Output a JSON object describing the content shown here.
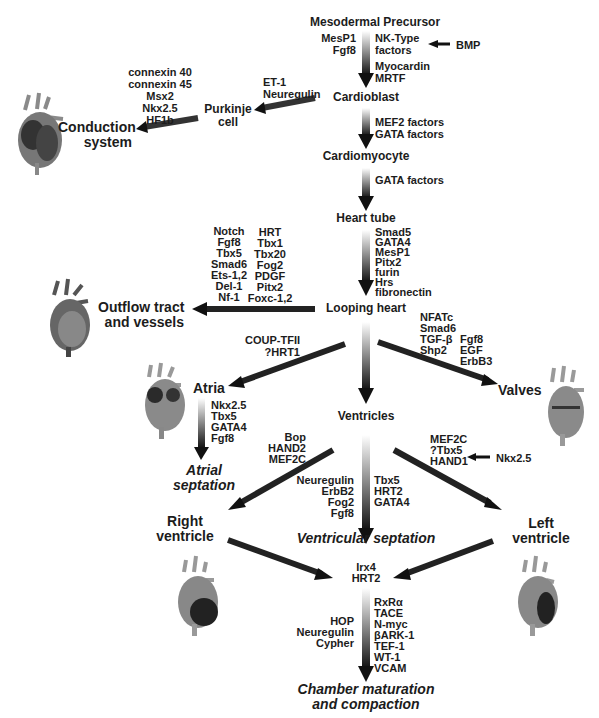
{
  "diagram": {
    "stages": {
      "mesodermal_precursor": "Mesodermal Precursor",
      "cardioblast": "Cardioblast",
      "cardiomyocyte": "Cardiomyocyte",
      "heart_tube": "Heart tube",
      "looping_heart": "Looping heart",
      "ventricles": "Ventricles",
      "purkinje_cell": [
        "Purkinje",
        "cell"
      ],
      "conduction_system": [
        "Conduction",
        "system"
      ],
      "outflow_tract": [
        "Outflow tract",
        "and vessels"
      ],
      "atria": "Atria",
      "valves": "Valves",
      "right_ventricle": [
        "Right",
        "ventricle"
      ],
      "left_ventricle": [
        "Left",
        "ventricle"
      ],
      "atrial_septation": [
        "Atrial",
        "septation"
      ],
      "ventricular_septation": "Ventricular septation",
      "chamber_maturation": [
        "Chamber maturation",
        "and compaction"
      ]
    },
    "factors": {
      "precursor_left": [
        "MesP1",
        "Fgf8"
      ],
      "precursor_right": [
        "NK-Type",
        "factors"
      ],
      "bmp": "BMP",
      "myocardin": [
        "Myocardin",
        "MRTF"
      ],
      "cardioblast_to_cardiomyocyte": [
        "MEF2 factors",
        "GATA factors"
      ],
      "cardiomyocyte_to_tube": [
        "GATA factors"
      ],
      "purkinje_inputs": [
        "ET-1",
        "Neuregulin"
      ],
      "conduction_factors": [
        "connexin 40",
        "connexin 45",
        "Msx2",
        "Nkx2.5",
        "HF1b"
      ],
      "tube_to_looping": [
        "Smad5",
        "GATA4",
        "MesP1",
        "Pitx2",
        "furin",
        "Hrs",
        "fibronectin"
      ],
      "outflow_col1": [
        "Notch",
        "Fgf8",
        "Tbx5",
        "Smad6",
        "Ets-1,2",
        "Del-1",
        "Nf-1"
      ],
      "outflow_col2": [
        "HRT",
        "Tbx1",
        "Tbx20",
        "Fog2",
        "PDGF",
        "Pitx2",
        "Foxc-1,2"
      ],
      "atria_inputs": [
        "COUP-TFII",
        "?HRT1"
      ],
      "valves_col1": [
        "NFATc",
        "Smad6",
        "TGF-β",
        "Shp2"
      ],
      "valves_col2": [
        "Fgf8",
        "EGF",
        "ErbB3"
      ],
      "atrial_septation": [
        "Nkx2.5",
        "Tbx5",
        "GATA4",
        "Fgf8"
      ],
      "right_ventricle_inputs": [
        "Bop",
        "HAND2",
        "MEF2C"
      ],
      "left_ventricle_inputs": [
        "MEF2C",
        "?Tbx5",
        "HAND1"
      ],
      "nkx25_hand1": "Nkx2.5",
      "vsept_left": [
        "Neuregulin",
        "ErbB2",
        "Fog2",
        "Fgf8"
      ],
      "vsept_right": [
        "Tbx5",
        "HRT2",
        "GATA4"
      ],
      "merge": [
        "Irx4",
        "HRT2"
      ],
      "maturation_left": [
        "HOP",
        "Neuregulin",
        "Cypher"
      ],
      "maturation_right": [
        "RxRα",
        "TACE",
        "N-myc",
        "βARK-1",
        "TEF-1",
        "WT-1",
        "VCAM"
      ]
    },
    "icons": [
      "heart-conduction-icon",
      "heart-outflow-icon",
      "heart-atria-icon",
      "heart-valves-icon",
      "heart-right-ventricle-icon",
      "heart-left-ventricle-icon"
    ],
    "colors": {
      "arrow": "#141414",
      "text": "#1c1c1c",
      "heart_dark": "#3a3a3a",
      "heart_mid": "#7a7a7a",
      "heart_light": "#a8a8a8"
    }
  }
}
